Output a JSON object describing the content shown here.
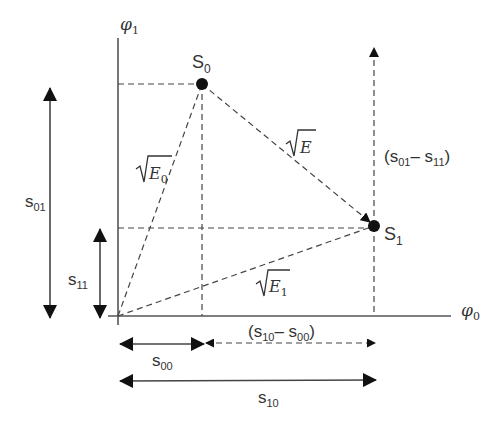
{
  "diagram": {
    "axes": {
      "x_label": "φ",
      "x_sub": "0",
      "y_label": "φ",
      "y_sub": "1"
    },
    "points": [
      {
        "id": "S0",
        "label": "S",
        "sub": "0"
      },
      {
        "id": "S1",
        "label": "S",
        "sub": "1"
      }
    ],
    "distances": {
      "E": "E",
      "E0": "E",
      "E0_sub": "0",
      "E1": "E",
      "E1_sub": "1"
    },
    "dimensions": {
      "s01": {
        "label": "s",
        "sub": "01"
      },
      "s11": {
        "label": "s",
        "sub": "11"
      },
      "s00": {
        "label": "s",
        "sub": "00"
      },
      "s10": {
        "label": "s",
        "sub": "10"
      },
      "diff_vertical": {
        "open": "(s",
        "sub_a": "01",
        "mid": "– s",
        "sub_b": "11",
        "close": ")"
      },
      "diff_horizontal": {
        "open": "(s",
        "sub_a": "10",
        "mid": "– s",
        "sub_b": "00",
        "close": ")"
      }
    },
    "colors": {
      "ink": "#333333",
      "point": "#111111"
    }
  }
}
